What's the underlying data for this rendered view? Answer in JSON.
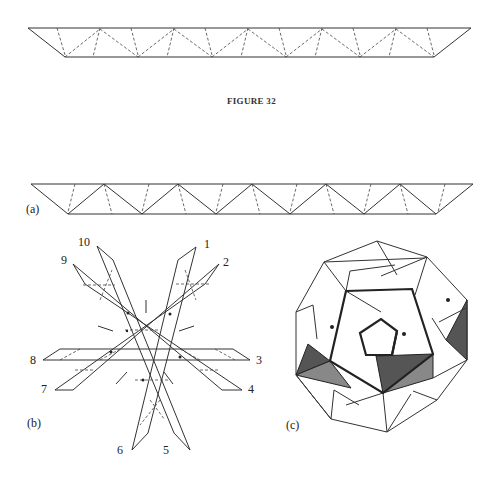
{
  "figure": {
    "title": "FIGURE 32",
    "panels": {
      "a": {
        "label": "(a)"
      },
      "b": {
        "label": "(b)",
        "strip_numbers": [
          "1",
          "2",
          "3",
          "4",
          "5",
          "6",
          "7",
          "8",
          "9",
          "10"
        ]
      },
      "c": {
        "label": "(c)"
      }
    },
    "colors": {
      "line": "#333333",
      "dark_shade": "#555555",
      "light_shade": "#888888",
      "background": "#ffffff"
    }
  }
}
